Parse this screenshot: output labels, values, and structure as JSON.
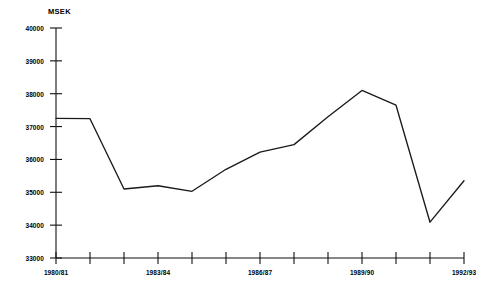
{
  "chart_data": {
    "type": "line",
    "title": "",
    "subtitle": "",
    "unit_label": "MSEK",
    "xlabel": "",
    "ylabel": "MSEK",
    "ylim": [
      33000,
      40000
    ],
    "ytick_step": 1000,
    "grid": false,
    "legend": "none",
    "categories": [
      "1980/81",
      "1981/82",
      "1982/83",
      "1983/84",
      "1984/85",
      "1985/86",
      "1986/87",
      "1987/88",
      "1988/89",
      "1989/90",
      "1990/91",
      "1991/92",
      "1992/93"
    ],
    "xtick_labels_shown": [
      "1980/81",
      "1983/84",
      "1986/87",
      "1989/90",
      "1992/93"
    ],
    "xtick_label_indices": [
      0,
      3,
      6,
      9,
      12
    ],
    "ytick_labels": [
      "40000",
      "39000",
      "38000",
      "37000",
      "36000",
      "35000",
      "34000",
      "33000"
    ],
    "ytick_values": [
      40000,
      39000,
      38000,
      37000,
      36000,
      35000,
      34000,
      33000
    ],
    "values": [
      37250,
      37240,
      35100,
      35200,
      35030,
      35700,
      36220,
      36450,
      37300,
      38100,
      37650,
      34090,
      35350
    ],
    "series": [
      {
        "name": "MSEK",
        "color": "#1a1a1a",
        "values": [
          37250,
          37240,
          35100,
          35200,
          35030,
          35700,
          36220,
          36450,
          37300,
          38100,
          37650,
          34090,
          35350
        ]
      }
    ]
  }
}
